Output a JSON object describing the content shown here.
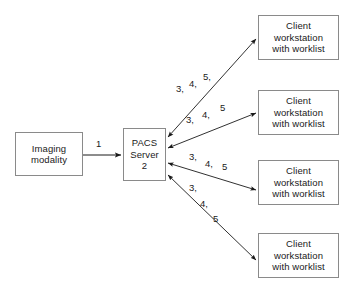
{
  "diagram": {
    "background_color": "#ffffff",
    "box_border_color": "#8a8a8a",
    "edge_color": "#1a1a1a",
    "text_color": "#1a1a1a"
  },
  "nodes": {
    "modality": {
      "name": "Imaging modality",
      "lines": [
        "Imaging",
        "modality"
      ]
    },
    "pacs": {
      "name": "PACS Server 2",
      "lines": [
        "PACS",
        "Server",
        "2"
      ]
    },
    "clients": [
      {
        "name": "Client workstation with worklist",
        "lines": [
          "Client",
          "workstation",
          "with worklist"
        ]
      },
      {
        "name": "Client workstation with worklist",
        "lines": [
          "Client",
          "workstation",
          "with worklist"
        ]
      },
      {
        "name": "Client workstation with worklist",
        "lines": [
          "Client",
          "workstation",
          "with worklist"
        ]
      },
      {
        "name": "Client workstation with worklist",
        "lines": [
          "Client",
          "workstation",
          "with worklist"
        ]
      }
    ]
  },
  "edges": {
    "modality_to_pacs": {
      "label": "1",
      "direction": "one-way",
      "from": "Imaging modality",
      "to": "PACS Server 2"
    },
    "pacs_to_clients": [
      {
        "direction": "two-way",
        "from": "PACS Server 2",
        "to": "Client workstation with worklist 1",
        "label_parts": [
          "3,",
          "4,",
          "5,"
        ]
      },
      {
        "direction": "two-way",
        "from": "PACS Server 2",
        "to": "Client workstation with worklist 2",
        "label_parts": [
          "3,",
          "4,",
          "5"
        ]
      },
      {
        "direction": "two-way",
        "from": "PACS Server 2",
        "to": "Client workstation with worklist 3",
        "label_parts": [
          "3,",
          "4,",
          "5"
        ]
      },
      {
        "direction": "two-way",
        "from": "PACS Server 2",
        "to": "Client workstation with worklist 4",
        "label_parts": [
          "3,",
          "4,",
          "5"
        ]
      }
    ]
  }
}
